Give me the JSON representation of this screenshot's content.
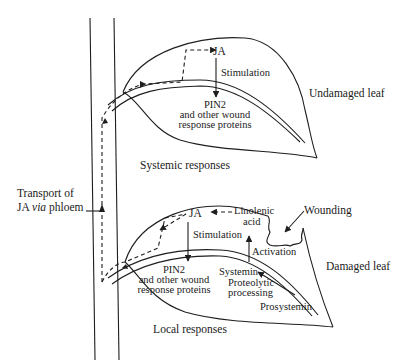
{
  "diagram": {
    "type": "biological-signaling-pathway",
    "colors": {
      "ink": "#1e1e1e",
      "background": "#ffffff"
    },
    "upper_leaf": {
      "label": "Undamaged leaf",
      "ja_label": "JA",
      "stimulation_label": "Stimulation",
      "pin2_label": "PIN2",
      "proteins_line1": "and other wound",
      "proteins_line2": "response proteins",
      "caption": "Systemic responses"
    },
    "lower_leaf": {
      "label": "Damaged leaf",
      "ja_label": "JA",
      "linolenic_line1": "Linolenic",
      "linolenic_line2": "acid",
      "wounding_label": "Wounding",
      "stimulation_label": "Stimulation",
      "activation_label": "Activation",
      "pin2_label": "PIN2",
      "proteins_line1": "and other wound",
      "proteins_line2": "response proteins",
      "systemin_label": "Systemin",
      "proteolytic_line1": "Proteolytic",
      "proteolytic_line2": "processing",
      "prosystemin_label": "Prosystemin",
      "caption": "Local responses"
    },
    "stem": {
      "transport_line1": "Transport of",
      "transport_line2_prefix": "JA ",
      "transport_line2_italic": "via",
      "transport_line2_suffix": " phloem"
    }
  }
}
